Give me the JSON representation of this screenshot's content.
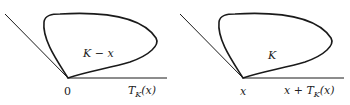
{
  "left_panel": {
    "set_label": "K − x",
    "vertex_label": "0",
    "cone_label_main": "T",
    "cone_label_sub": "K",
    "cone_label_arg": "(x)"
  },
  "right_panel": {
    "set_label": "K",
    "vertex_label": "x",
    "cone_label_prefix": "x + T",
    "cone_label_sub": "K",
    "cone_label_arg": "(x)"
  },
  "colors": {
    "stroke": "#1a1a1a",
    "text": "#222222",
    "background": "#ffffff"
  }
}
